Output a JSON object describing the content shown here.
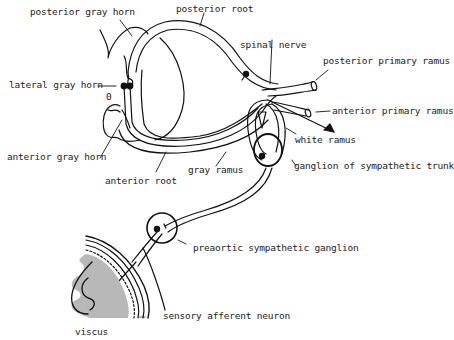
{
  "diagram": {
    "type": "anatomical-line-drawing",
    "colors": {
      "ink": "#111111",
      "text": "#222222",
      "viscus_fill": "#b8b8b8",
      "background": "#ffffff"
    },
    "labels": {
      "posterior_gray_horn": "posterior gray horn",
      "posterior_root": "posterior root",
      "spinal_nerve": "spinal nerve",
      "posterior_primary_ramus": "posterior primary ramus",
      "lateral_gray_horn": "lateral gray horn",
      "zero_marker": "0",
      "anterior_primary_ramus": "anterior primary ramus",
      "white_ramus": "white ramus",
      "anterior_gray_horn": "anterior gray horn",
      "gray_ramus": "gray ramus",
      "ganglion_of_sympathetic_trunk": "ganglion of sympathetic trunk",
      "anterior_root": "anterior root",
      "preaortic_sympathetic_ganglion": "preaortic sympathetic ganglion",
      "sensory_afferent_neuron": "sensory afferent neuron",
      "viscus": "viscus",
      "signature": "vac"
    }
  }
}
